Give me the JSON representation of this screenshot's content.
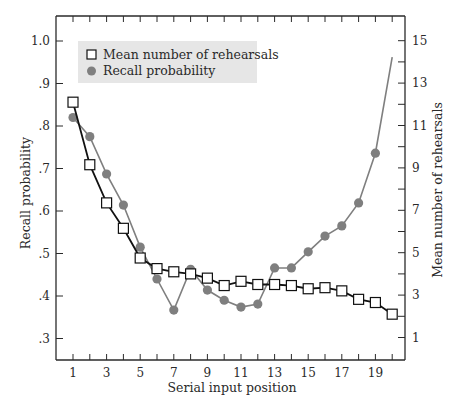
{
  "chart_data": {
    "type": "line",
    "title": "",
    "xlabel": "Serial input position",
    "ylabel": "Recall probability",
    "ylabel_right": "Mean number of rehearsals",
    "x": [
      1,
      2,
      3,
      4,
      5,
      6,
      7,
      8,
      9,
      10,
      11,
      12,
      13,
      14,
      15,
      16,
      17,
      18,
      19,
      20
    ],
    "x_tick_labels": [
      "1",
      "3",
      "5",
      "7",
      "9",
      "11",
      "13",
      "15",
      "17",
      "19"
    ],
    "xlim": [
      1,
      20
    ],
    "ylim_left": [
      0.3,
      1.0
    ],
    "y_tick_labels_left": [
      "1.0",
      ".9",
      ".8",
      ".7",
      ".6",
      ".5",
      ".4",
      ".3"
    ],
    "y_ticks_left": [
      1.0,
      0.9,
      0.8,
      0.7,
      0.6,
      0.5,
      0.4,
      0.3
    ],
    "ylim_right": [
      1,
      15
    ],
    "y_tick_labels_right": [
      "15",
      "13",
      "11",
      "9",
      "7",
      "5",
      "3",
      "1"
    ],
    "y_ticks_right": [
      15,
      13,
      11,
      9,
      7,
      5,
      3,
      1
    ],
    "grid": false,
    "legend_position": "upper left",
    "series": [
      {
        "name": "Mean number of rehearsals",
        "axis": "right",
        "marker": "open-square",
        "color": "#111111",
        "values": [
          12.1,
          9.15,
          7.35,
          6.15,
          4.75,
          4.25,
          4.1,
          4.0,
          3.8,
          3.45,
          3.65,
          3.5,
          3.5,
          3.45,
          3.3,
          3.35,
          3.2,
          2.8,
          2.65,
          2.1
        ]
      },
      {
        "name": "Recall probability",
        "axis": "left",
        "marker": "filled-circle",
        "color": "#7f7f7f",
        "values": [
          0.82,
          0.775,
          0.687,
          0.614,
          0.515,
          0.44,
          0.367,
          0.463,
          0.414,
          0.39,
          0.374,
          0.381,
          0.466,
          0.466,
          0.504,
          0.541,
          0.565,
          0.619,
          0.736,
          0.962
        ],
        "last_point_marker": false
      }
    ]
  },
  "legend": {
    "items": [
      {
        "label": "Mean number of rehearsals",
        "icon": "open-square-icon"
      },
      {
        "label": "Recall probability",
        "icon": "filled-circle-icon"
      }
    ],
    "background": "#e6e6e6"
  },
  "colors": {
    "axis": "#2a2a2a",
    "rehearsal_line": "#111111",
    "recall_line": "#7f7f7f",
    "legend_bg": "#e6e6e6"
  }
}
